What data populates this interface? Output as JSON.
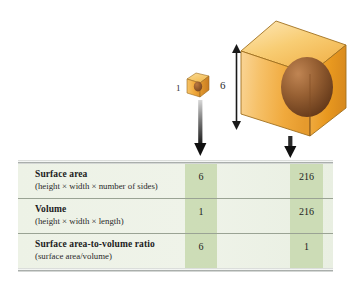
{
  "figure": {
    "background": "#ffffff"
  },
  "diagram": {
    "small_cube": {
      "name": "small-cube",
      "dimension_label": "1",
      "face_color": "#f0a93c",
      "top_color": "#f6c766",
      "side_color": "#d9872b",
      "sphere_color": "#8a5026"
    },
    "large_cube": {
      "name": "large-cube",
      "dimension_label": "6",
      "face_color": "#f3b24a",
      "top_color": "#f8cd74",
      "side_color": "#e1952f",
      "sphere_color": "#8a5026"
    },
    "dimension_arrow": {
      "name": "height-dimension-arrow",
      "label": "6",
      "style": "double-headed-vertical"
    },
    "pointer_arrows": [
      {
        "name": "small-cube-pointer-arrow",
        "label": "",
        "direction": "down"
      },
      {
        "name": "large-cube-pointer-arrow",
        "label": "",
        "direction": "down"
      }
    ]
  },
  "table": {
    "highlight_color": "#c7d8ae",
    "background_color": "#edf2e6",
    "rows": [
      {
        "label": "Surface area",
        "formula": "(height × width × number of sides)",
        "small_cube_value": "6",
        "large_cube_value": "216"
      },
      {
        "label": "Volume",
        "formula": "(height × width × length)",
        "small_cube_value": "1",
        "large_cube_value": "216"
      },
      {
        "label": "Surface area-to-volume ratio",
        "formula": "(surface area/volume)",
        "small_cube_value": "6",
        "large_cube_value": "1"
      }
    ]
  }
}
